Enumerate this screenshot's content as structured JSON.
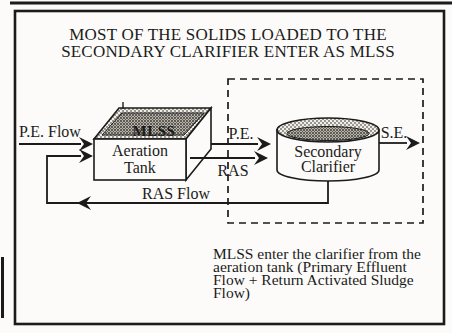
{
  "figure": {
    "kind": "process-flow-diagram",
    "title": {
      "line1": "MOST OF THE SOLIDS LOADED TO THE",
      "line2": "SECONDARY CLARIFIER ENTER AS MLSS"
    },
    "colors": {
      "ink": "#1b1b1b",
      "paper": "#fcfbf9",
      "hatch_light": "#9a968e",
      "hatch_dark": "#605c54"
    },
    "aeration_tank": {
      "label_line1": "Aeration",
      "label_line2": "Tank",
      "contents_label": "MLSS"
    },
    "secondary_clarifier": {
      "label_line1": "Secondary",
      "label_line2": "Clarifier"
    },
    "flows": {
      "primary_effluent_in": "P.E. Flow",
      "primary_effluent_short": "P.E.",
      "return_activated_sludge_short": "RAS",
      "secondary_effluent_short": "S.E.",
      "return_activated_sludge_loop": "RAS Flow"
    },
    "caption": {
      "line1": "MLSS enter the clarifier from the",
      "line2": "aeration tank (Primary Effluent",
      "line3": "Flow + Return Activated Sludge",
      "line4": "Flow)"
    }
  }
}
